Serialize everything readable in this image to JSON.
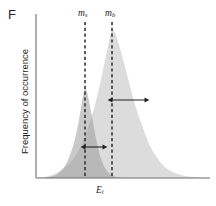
{
  "panel": {
    "label": "F"
  },
  "axes": {
    "ylabel": "Frequency of occurrence",
    "xlabel_main": "E",
    "xlabel_sub": "i"
  },
  "annotations": {
    "mean_signal": {
      "symbol": "m",
      "sub": "s"
    },
    "mean_background": {
      "symbol": "m",
      "sub": "b"
    },
    "sigma_signal": {
      "symbol": "σ",
      "sub": "s"
    },
    "sigma_background": {
      "symbol": "σ",
      "sub": "b"
    }
  },
  "colors": {
    "signal_fill": "#c9c9c9",
    "background_fill": "#dcdcdc",
    "overlap_fill": "#b8b8b8",
    "axis": "#6f6f6f",
    "text": "#231f20",
    "dashed_line": "#2b2b2b",
    "arrow": "#231f20"
  },
  "chart_data": {
    "type": "area",
    "title": "",
    "xlabel": "E_i",
    "ylabel": "Frequency of occurrence",
    "grid": false,
    "legend_position": "none",
    "axis_pixels": {
      "y_axis_x": 36,
      "baseline_y": 178,
      "x_axis_right": 210,
      "y_axis_top": 14
    },
    "series": [
      {
        "name": "signal",
        "mean_label": "m_s",
        "sigma_label": "σ_s",
        "mean_x_px": 85,
        "peak_y_px": 88,
        "sigma_px": 18,
        "fill": "#c9c9c9",
        "amplitude_rel": 0.61,
        "points_px": [
          [
            44,
            178
          ],
          [
            50,
            177
          ],
          [
            56,
            175
          ],
          [
            61,
            171
          ],
          [
            66,
            164
          ],
          [
            70,
            155
          ],
          [
            74,
            143
          ],
          [
            78,
            125
          ],
          [
            81,
            108
          ],
          [
            83,
            96
          ],
          [
            85,
            88
          ],
          [
            87,
            92
          ],
          [
            89,
            101
          ],
          [
            92,
            117
          ],
          [
            95,
            134
          ],
          [
            98,
            148
          ],
          [
            101,
            159
          ],
          [
            105,
            168
          ],
          [
            110,
            174
          ],
          [
            116,
            177
          ],
          [
            122,
            178
          ]
        ]
      },
      {
        "name": "background",
        "mean_label": "m_b",
        "sigma_label": "σ_b",
        "mean_x_px": 112,
        "peak_y_px": 30,
        "sigma_px": 33,
        "fill": "#dcdcdc",
        "amplitude_rel": 1.0,
        "points_px": [
          [
            36,
            178
          ],
          [
            44,
            177
          ],
          [
            52,
            175
          ],
          [
            60,
            171
          ],
          [
            68,
            165
          ],
          [
            76,
            155
          ],
          [
            83,
            141
          ],
          [
            90,
            122
          ],
          [
            96,
            101
          ],
          [
            102,
            75
          ],
          [
            107,
            51
          ],
          [
            110,
            37
          ],
          [
            112,
            30
          ],
          [
            115,
            33
          ],
          [
            119,
            45
          ],
          [
            124,
            63
          ],
          [
            130,
            86
          ],
          [
            136,
            108
          ],
          [
            143,
            128
          ],
          [
            150,
            146
          ],
          [
            158,
            159
          ],
          [
            166,
            168
          ],
          [
            175,
            173
          ],
          [
            185,
            176
          ],
          [
            196,
            177
          ],
          [
            208,
            178
          ]
        ]
      }
    ],
    "arrows": [
      {
        "name": "sigma_s",
        "x_from_px": 85,
        "x_to_px": 103,
        "y_px": 147,
        "label": "σ_s"
      },
      {
        "name": "sigma_b",
        "x_from_px": 112,
        "x_to_px": 145,
        "y_px": 100,
        "label": "σ_b"
      }
    ],
    "dashed_lines": [
      {
        "name": "m_s",
        "x_px": 85,
        "y_top_px": 22,
        "y_bottom_px": 178
      },
      {
        "name": "m_b",
        "x_px": 112,
        "y_top_px": 22,
        "y_bottom_px": 178
      }
    ]
  }
}
